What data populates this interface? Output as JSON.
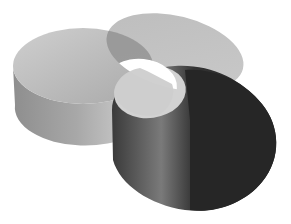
{
  "diagram": {
    "type": "three-set-venn-3d-cylinders",
    "background": "#ffffff",
    "sets": [
      {
        "id": "left",
        "label": "",
        "top_color": "#b4b4b4",
        "side_color_light": "#c8c8c8",
        "side_color_dark": "#8a8a8a"
      },
      {
        "id": "back",
        "label": "",
        "top_color": "#bdbdbd",
        "side_color_light": "#cfcfcf",
        "side_color_dark": "#9a9a9a"
      },
      {
        "id": "front",
        "label": "",
        "top_color": "#2a2a2a",
        "side_color_light": "#6a6a6a",
        "side_color_dark": "#222222"
      }
    ],
    "center_intersection_color": "#ffffff",
    "labels_visible": false
  }
}
